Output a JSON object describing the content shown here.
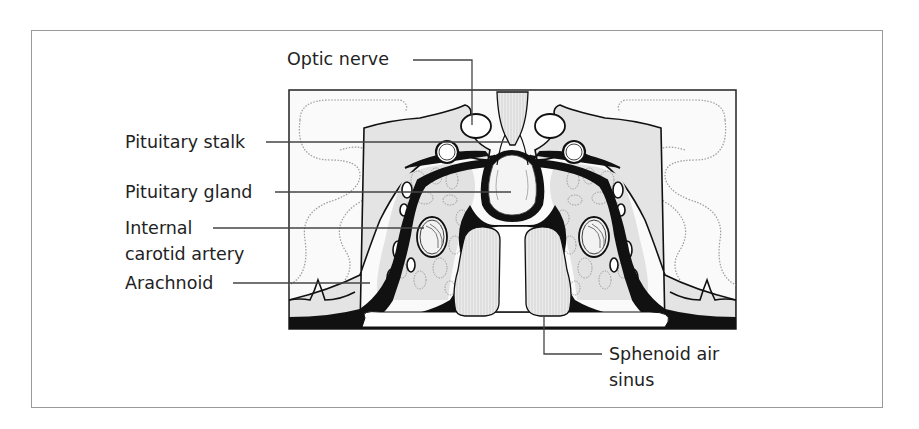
{
  "figure": {
    "labels": {
      "optic_nerve": "Optic nerve",
      "pituitary_stalk": "Pituitary stalk",
      "pituitary_gland": "Pituitary gland",
      "internal_carotid_line1": "Internal",
      "internal_carotid_line2": "carotid artery",
      "arachnoid": "Arachnoid",
      "sphenoid_line1": "Sphenoid air",
      "sphenoid_line2": "sinus"
    },
    "colors": {
      "outline": "#111111",
      "fill_grey": "#e6e6e6",
      "dotted": "#999999",
      "leader": "#444444",
      "frame": "#9a9a9a"
    }
  }
}
